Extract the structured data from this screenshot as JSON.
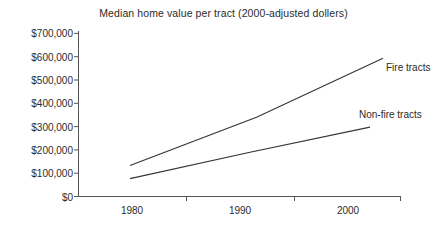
{
  "chart_data": {
    "type": "line",
    "title": "Median home value per tract (2000-adjusted dollers)",
    "xlabel": "",
    "ylabel": "",
    "x": [
      1980,
      1990,
      2000
    ],
    "xtick_labels": [
      "1980",
      "1990",
      "2000"
    ],
    "ytick_labels": [
      "$0",
      "$100,000",
      "$200,000",
      "$300,000",
      "$400,000",
      "$500,000",
      "$600,000",
      "$700,000"
    ],
    "ytick_values": [
      0,
      100000,
      200000,
      300000,
      400000,
      500000,
      600000,
      700000
    ],
    "ylim": [
      0,
      700000
    ],
    "xlim": [
      1980,
      2000
    ],
    "grid": false,
    "legend_position": "inline-right",
    "series": [
      {
        "name": "Fire tracts",
        "values": [
          133000,
          340000,
          593000
        ],
        "color": "#333333",
        "label_x": 1999,
        "label_y": 505000
      },
      {
        "name": "Non-fire tracts",
        "values": [
          77000,
          190000,
          298000
        ],
        "color": "#333333",
        "label_x": 1997,
        "label_y": 360000
      }
    ],
    "axis_color": "#555555"
  }
}
